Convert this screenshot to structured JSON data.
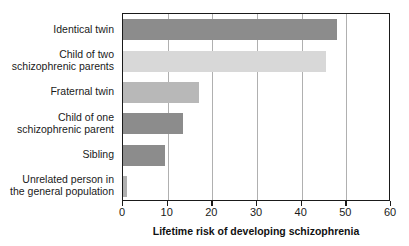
{
  "chart_data": {
    "type": "bar",
    "orientation": "horizontal",
    "title": "",
    "xlabel": "Lifetime risk of developing schizophrenia",
    "ylabel": "",
    "xlim": [
      0,
      60
    ],
    "xticks": [
      0,
      10,
      20,
      30,
      40,
      50,
      60
    ],
    "xtick_labels": [
      "0",
      "10",
      "20",
      "30",
      "40",
      "50",
      "60"
    ],
    "grid": "vertical",
    "legend": "none",
    "categories": [
      "Identical twin",
      "Child of two\nschizophrenic parents",
      "Fraternal twin",
      "Child of one\nschizophrenic parent",
      "Sibling",
      "Unrelated person in\nthe general population"
    ],
    "values": [
      48,
      45.5,
      17,
      13.5,
      9.5,
      1
    ],
    "bar_colors": [
      "#8c8c8c",
      "#d8d8d8",
      "#b8b8b8",
      "#8c8c8c",
      "#8c8c8c",
      "#b0b0b0"
    ],
    "axis_color": "#1a1a1a",
    "gridline_color": "#b0b0b0",
    "background": "#ffffff"
  }
}
